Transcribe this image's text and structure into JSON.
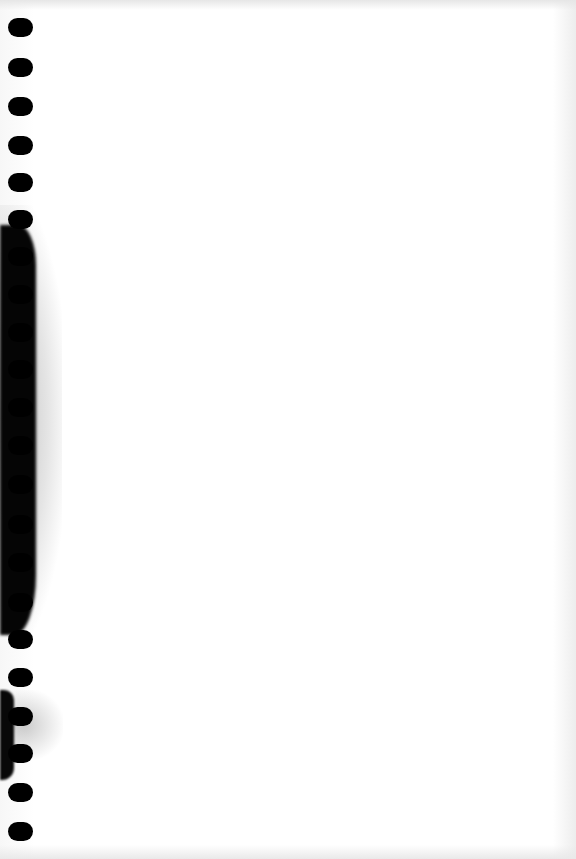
{
  "page": {
    "type": "blank notebook page",
    "background_color": "#ffffff",
    "binding": "spiral",
    "stain_color": "#050505"
  },
  "binding_holes": [
    {
      "y": 28
    },
    {
      "y": 68
    },
    {
      "y": 107
    },
    {
      "y": 146
    },
    {
      "y": 183
    },
    {
      "y": 220
    },
    {
      "y": 257
    },
    {
      "y": 295
    },
    {
      "y": 333
    },
    {
      "y": 370
    },
    {
      "y": 408
    },
    {
      "y": 446
    },
    {
      "y": 485
    },
    {
      "y": 525
    },
    {
      "y": 563
    },
    {
      "y": 603
    },
    {
      "y": 640
    },
    {
      "y": 678
    },
    {
      "y": 717
    },
    {
      "y": 754
    },
    {
      "y": 793
    },
    {
      "y": 832
    }
  ]
}
